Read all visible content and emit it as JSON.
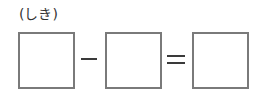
{
  "label": "(しき)",
  "equation": {
    "operand1": "",
    "operator1": "−",
    "operand2": "",
    "operator2": "=",
    "result": ""
  },
  "colors": {
    "box_border": "#7a7a7a",
    "text": "#333333",
    "operator": "#3a3a3a"
  }
}
